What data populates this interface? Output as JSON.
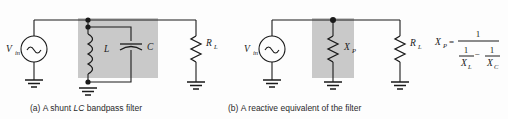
{
  "figure": {
    "background": "#fdfdfd",
    "shade_color": "#c9c9c9",
    "line_color": "#1a1a1a"
  },
  "panel_a": {
    "caption_index": "(a)",
    "caption_text_1": "A shunt ",
    "caption_italic": "LC",
    "caption_text_2": " bandpass filter",
    "source_label": "V",
    "source_sub": "in",
    "source_symbol": "ac-sine",
    "inductor_label": "L",
    "capacitor_label": "C",
    "load_label": "R",
    "load_sub": "L"
  },
  "panel_b": {
    "caption_index": "(b)",
    "caption_text": "A reactive equivalent of the filter",
    "source_label": "V",
    "source_sub": "in",
    "source_symbol": "ac-sine",
    "reactance_label": "X",
    "reactance_sub": "P",
    "load_label": "R",
    "load_sub": "L"
  },
  "formula": {
    "lhs_main": "X",
    "lhs_sub": "P",
    "equals": "=",
    "numerator": "1",
    "denom_left_num": "1",
    "denom_left_den_main": "X",
    "denom_left_den_sub": "L",
    "denom_operator": "−",
    "denom_right_num": "1",
    "denom_right_den_main": "X",
    "denom_right_den_sub": "C"
  }
}
